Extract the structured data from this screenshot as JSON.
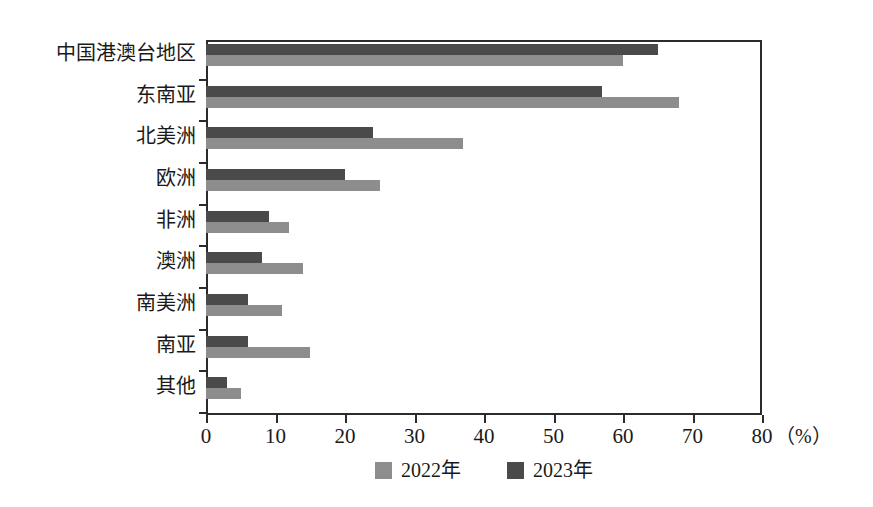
{
  "chart_data": {
    "type": "bar",
    "orientation": "horizontal",
    "title": "",
    "subtitle": "",
    "xlabel": "（%）",
    "ylabel": "",
    "xlim": [
      0,
      80
    ],
    "xticks": [
      0,
      10,
      20,
      30,
      40,
      50,
      60,
      70,
      80
    ],
    "xtick_labels": [
      "0",
      "10",
      "20",
      "30",
      "40",
      "50",
      "60",
      "70",
      "80"
    ],
    "grid": false,
    "legend_position": "bottom-center",
    "categories": [
      "中国港澳台地区",
      "东南亚",
      "北美洲",
      "欧洲",
      "非洲",
      "澳洲",
      "南美洲",
      "南亚",
      "其他"
    ],
    "series": [
      {
        "name": "2022年",
        "color": "#8d8d8d",
        "values": [
          60,
          68,
          37,
          25,
          12,
          14,
          11,
          15,
          5
        ]
      },
      {
        "name": "2023年",
        "color": "#4a4a4a",
        "values": [
          65,
          57,
          24,
          20,
          9,
          8,
          6,
          6,
          3
        ]
      }
    ],
    "unit": "%",
    "annotations": []
  },
  "legend": {
    "items": [
      {
        "label": "2022年",
        "color": "#8d8d8d"
      },
      {
        "label": "2023年",
        "color": "#4a4a4a"
      }
    ]
  },
  "axis": {
    "unit_label": "（%）"
  },
  "colors": {
    "series_2022": "#8d8d8d",
    "series_2023": "#4a4a4a",
    "frame": "#2b2b2b",
    "text": "#1a1a1a",
    "background": "#ffffff"
  }
}
